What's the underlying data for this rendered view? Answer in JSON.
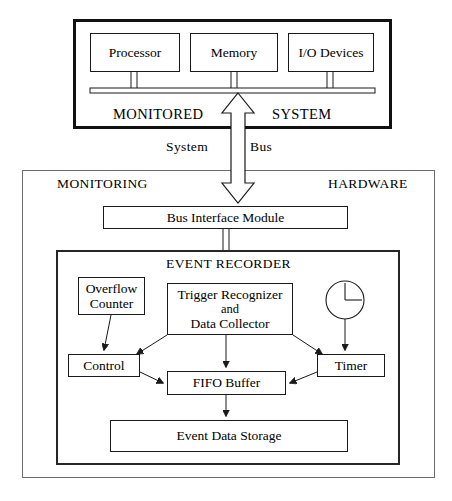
{
  "diagram": {
    "type": "block-diagram"
  },
  "monitored_system": {
    "label_left": "MONITORED",
    "label_right": "SYSTEM",
    "blocks": [
      {
        "id": "processor",
        "label": "Processor"
      },
      {
        "id": "memory",
        "label": "Memory"
      },
      {
        "id": "io-devices",
        "label": "I/O Devices"
      }
    ],
    "bus_bar": "system-bus-bar"
  },
  "bus_link": {
    "label_left": "System",
    "label_right": "Bus",
    "arrow": "bidirectional-hollow-arrow"
  },
  "monitoring_hardware": {
    "label_left": "MONITORING",
    "label_right": "HARDWARE",
    "bus_interface": {
      "id": "bus-interface-module",
      "label": "Bus Interface Module"
    }
  },
  "event_recorder": {
    "title": "EVENT RECORDER",
    "blocks": {
      "overflow_counter": {
        "line1": "Overflow",
        "line2": "Counter"
      },
      "trigger": {
        "line1": "Trigger Recognizer",
        "line2": "and",
        "line3": "Data Collector"
      },
      "clock": {
        "id": "clock-icon"
      },
      "control": {
        "label": "Control"
      },
      "timer": {
        "label": "Timer"
      },
      "fifo": {
        "label": "FIFO Buffer"
      },
      "storage": {
        "label": "Event Data Storage"
      }
    }
  },
  "colors": {
    "ink": "#111111",
    "line": "#1a1a1a",
    "frame_hw": "#6d6d6d",
    "paper": "#ffffff"
  }
}
